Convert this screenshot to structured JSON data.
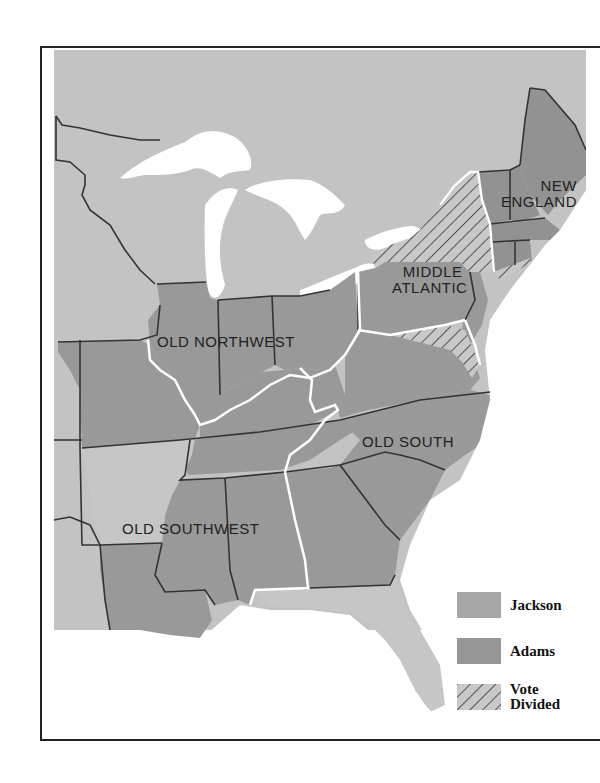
{
  "map": {
    "subject": "Presidential election vote by region",
    "colors": {
      "background_land": "#c4c4c4",
      "jackson": "#9c9c9c",
      "adams": "#8e8e8e",
      "non_state": "#c2c2c2",
      "water": "#ffffff",
      "border": "#333333",
      "region_border": "#ffffff"
    },
    "region_labels": [
      {
        "id": "new-england",
        "line1": "NEW",
        "line2": "ENGLAND"
      },
      {
        "id": "middle-atlantic",
        "line1": "MIDDLE",
        "line2": "ATLANTIC"
      },
      {
        "id": "old-northwest",
        "line1": "OLD NORTHWEST"
      },
      {
        "id": "old-south",
        "line1": "OLD SOUTH"
      },
      {
        "id": "old-southwest",
        "line1": "OLD SOUTHWEST"
      }
    ]
  },
  "legend": {
    "items": [
      {
        "label": "Jackson",
        "swatch": "solid-light"
      },
      {
        "label": "Adams",
        "swatch": "solid-dark"
      },
      {
        "label_line1": "Vote",
        "label_line2": "Divided",
        "swatch": "hatched"
      }
    ]
  }
}
